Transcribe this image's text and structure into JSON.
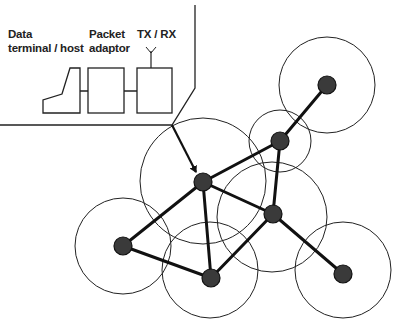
{
  "labels": {
    "terminal_line1": "Data",
    "terminal_line2": "terminal / host",
    "adaptor_line1": "Packet",
    "adaptor_line2": "adaptor",
    "radio": "TX / RX"
  },
  "station_components": [
    "Data terminal / host",
    "Packet adaptor",
    "TX / RX"
  ],
  "network": {
    "nodes": [
      {
        "id": "top-right",
        "range": "large"
      },
      {
        "id": "upper-relay",
        "range": "small"
      },
      {
        "id": "central",
        "range": "large"
      },
      {
        "id": "right-middle",
        "range": "large"
      },
      {
        "id": "left",
        "range": "large"
      },
      {
        "id": "bottom",
        "range": "large"
      },
      {
        "id": "bottom-right",
        "range": "large"
      }
    ],
    "links": [
      [
        "upper-relay",
        "top-right"
      ],
      [
        "central",
        "upper-relay"
      ],
      [
        "central",
        "right-middle"
      ],
      [
        "central",
        "left"
      ],
      [
        "central",
        "bottom"
      ],
      [
        "upper-relay",
        "right-middle"
      ],
      [
        "left",
        "bottom"
      ],
      [
        "bottom",
        "right-middle"
      ],
      [
        "right-middle",
        "bottom-right"
      ]
    ],
    "callout_target": "central"
  }
}
